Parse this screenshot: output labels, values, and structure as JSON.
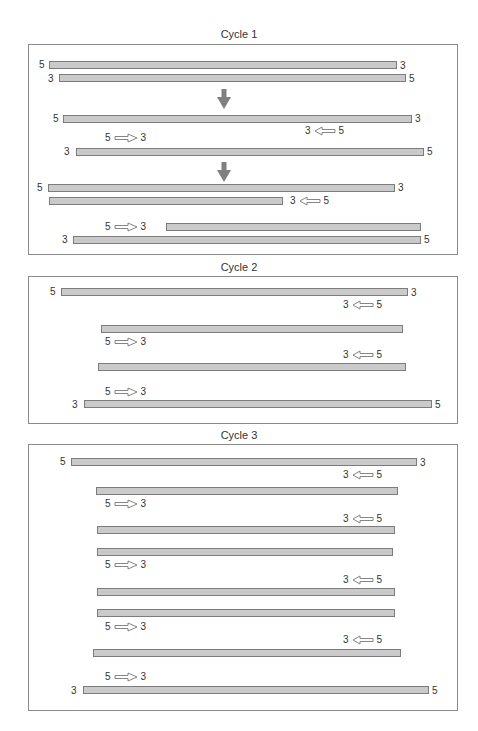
{
  "cycles": [
    {
      "title": "Cycle 1"
    },
    {
      "title": "Cycle 2"
    },
    {
      "title": "Cycle 3"
    }
  ],
  "ends": {
    "five": "5",
    "three": "3"
  },
  "primer_forward": {
    "left": "5",
    "right": "3",
    "direction": "right-arrow"
  },
  "primer_reverse": {
    "left": "3",
    "right": "5",
    "direction": "left-arrow"
  },
  "colors": {
    "strand_fill": "#cacaca",
    "strand_border": "#7c7c7c",
    "down_arrow": "#7f7f7f",
    "box_border": "#8a8a8a"
  },
  "cycle1": {
    "strands": [
      {
        "x": 49,
        "y": 61,
        "w": 348,
        "left_end": "5",
        "right_end": "3"
      },
      {
        "x": 59,
        "y": 74,
        "w": 347,
        "left_end": "3",
        "right_end": "5"
      },
      {
        "x": 63,
        "y": 115,
        "w": 349,
        "left_end": "5",
        "right_end": "3"
      },
      {
        "x": 76,
        "y": 148,
        "w": 348,
        "left_end": "3",
        "right_end": "5"
      },
      {
        "x": 48,
        "y": 184,
        "w": 347,
        "left_end": "5",
        "right_end": "3"
      },
      {
        "x": 49,
        "y": 197,
        "w": 234,
        "left_end": "",
        "right_end": ""
      },
      {
        "x": 166,
        "y": 223,
        "w": 255,
        "left_end": "",
        "right_end": ""
      },
      {
        "x": 73,
        "y": 236,
        "w": 348,
        "left_end": "3",
        "right_end": "5"
      }
    ]
  },
  "cycle2": {
    "strands": [
      {
        "x": 61,
        "y": 288,
        "w": 347,
        "left_end": "5",
        "right_end": "3"
      },
      {
        "x": 101,
        "y": 325,
        "w": 302,
        "left_end": "",
        "right_end": ""
      },
      {
        "x": 98,
        "y": 363,
        "w": 308,
        "left_end": "",
        "right_end": ""
      },
      {
        "x": 84,
        "y": 400,
        "w": 348,
        "left_end": "3",
        "right_end": "5"
      }
    ]
  },
  "cycle3": {
    "strands": [
      {
        "x": 71,
        "y": 458,
        "w": 346,
        "left_end": "5",
        "right_end": "3"
      },
      {
        "x": 96,
        "y": 487,
        "w": 302,
        "left_end": "",
        "right_end": ""
      },
      {
        "x": 97,
        "y": 526,
        "w": 298,
        "left_end": "",
        "right_end": ""
      },
      {
        "x": 97,
        "y": 548,
        "w": 296,
        "left_end": "",
        "right_end": ""
      },
      {
        "x": 97,
        "y": 588,
        "w": 298,
        "left_end": "",
        "right_end": ""
      },
      {
        "x": 97,
        "y": 609,
        "w": 298,
        "left_end": "",
        "right_end": ""
      },
      {
        "x": 93,
        "y": 649,
        "w": 308,
        "left_end": "",
        "right_end": ""
      },
      {
        "x": 83,
        "y": 686,
        "w": 346,
        "left_end": "3",
        "right_end": "5"
      }
    ]
  }
}
